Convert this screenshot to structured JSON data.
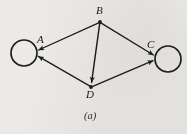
{
  "figure": {
    "caption": "(a)",
    "background_color": "#eceae6",
    "ink_color": "#1d1d1d",
    "diagram_type": "directed-graph",
    "nodes": [
      {
        "id": "A",
        "label": "A",
        "shape": "circle",
        "cx": 24,
        "cy": 53,
        "r": 13,
        "label_x": 37,
        "label_y": 35
      },
      {
        "id": "B",
        "label": "B",
        "shape": "dot",
        "cx": 100,
        "cy": 22,
        "r": 1.8,
        "label_x": 96,
        "label_y": 6
      },
      {
        "id": "C",
        "label": "C",
        "shape": "circle",
        "cx": 168,
        "cy": 59,
        "r": 13,
        "label_x": 147,
        "label_y": 40
      },
      {
        "id": "D",
        "label": "D",
        "shape": "dot",
        "cx": 91,
        "cy": 87,
        "r": 1.8,
        "label_x": 86,
        "label_y": 89
      }
    ],
    "edges": [
      {
        "id": "B-A",
        "from": "B",
        "to": "A",
        "arrow": "to",
        "directed": true
      },
      {
        "id": "B-D",
        "from": "B",
        "to": "D",
        "arrow": "to",
        "directed": true
      },
      {
        "id": "B-C",
        "from": "B",
        "to": "C",
        "arrow": "to",
        "directed": true
      },
      {
        "id": "D-A",
        "from": "D",
        "to": "A",
        "arrow": "to",
        "directed": true
      },
      {
        "id": "D-C",
        "from": "D",
        "to": "C",
        "arrow": "to",
        "directed": true
      }
    ],
    "caption_x": 84,
    "caption_y": 112
  }
}
